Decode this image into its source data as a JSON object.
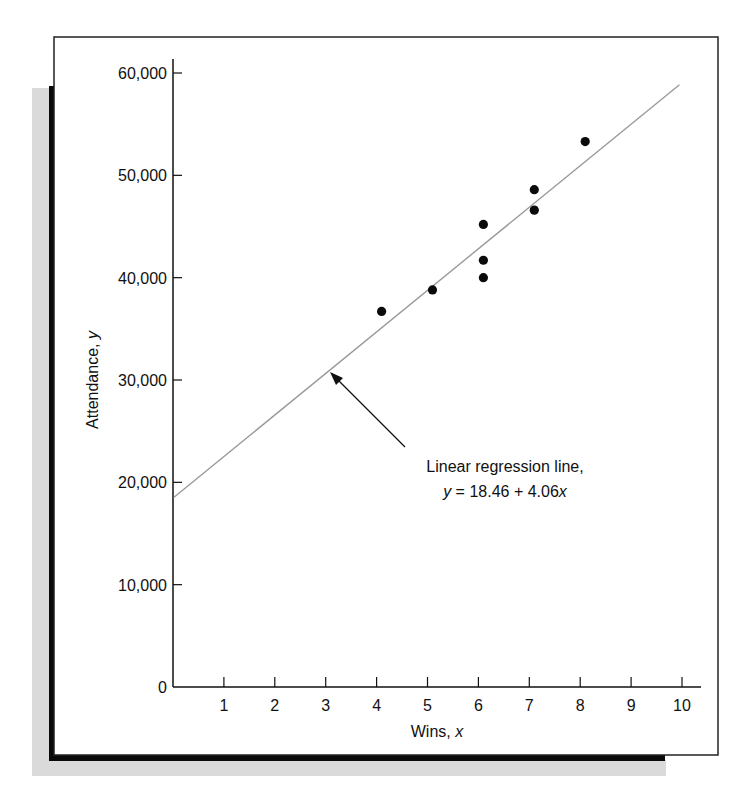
{
  "chart_data": {
    "type": "scatter",
    "title": "",
    "xlabel": "Wins, x",
    "ylabel": "Attendance, y",
    "xlim": [
      0,
      10.3
    ],
    "ylim": [
      0,
      61000
    ],
    "grid": false,
    "legend": null,
    "x_ticks": [
      1,
      2,
      3,
      4,
      5,
      6,
      7,
      8,
      9,
      10
    ],
    "x_tick_labels": [
      "1",
      "2",
      "3",
      "4",
      "5",
      "6",
      "7",
      "8",
      "9",
      "10"
    ],
    "y_ticks": [
      0,
      10000,
      20000,
      30000,
      40000,
      50000,
      60000
    ],
    "y_tick_labels": [
      "0",
      "10,000",
      "20,000",
      "30,000",
      "40,000",
      "50,000",
      "60,000"
    ],
    "series": [
      {
        "name": "Observed data",
        "type": "scatter",
        "points": [
          {
            "x": 4,
            "y": 36700
          },
          {
            "x": 5,
            "y": 38800
          },
          {
            "x": 6,
            "y": 45200
          },
          {
            "x": 6,
            "y": 41700
          },
          {
            "x": 6,
            "y": 40000
          },
          {
            "x": 7,
            "y": 48600
          },
          {
            "x": 7,
            "y": 46600
          },
          {
            "x": 8,
            "y": 53300
          }
        ]
      },
      {
        "name": "Linear regression line",
        "type": "line",
        "equation": "y = 18.46 + 4.06x",
        "points": [
          {
            "x": 0,
            "y": 18460
          },
          {
            "x": 10,
            "y": 59060
          }
        ]
      }
    ],
    "annotations": [
      {
        "text_line1": "Linear regression line,",
        "text_line2_prefix": "y",
        "text_line2_rest": " = 18.46 + 4.06",
        "text_line2_suffix": "x",
        "arrow_to": {
          "x": 3.1,
          "y": 31000
        }
      }
    ]
  },
  "labels": {
    "x_axis_title_main": "Wins, ",
    "x_axis_title_var": "x",
    "y_axis_title_main": "Attendance, ",
    "y_axis_title_var": "y"
  },
  "colors": {
    "axis": "#111111",
    "points": "#0a0a0a",
    "regression_line": "#9a9a9a",
    "frame_shadow": "#0a0a0a",
    "shade": "#d8d8d8"
  }
}
